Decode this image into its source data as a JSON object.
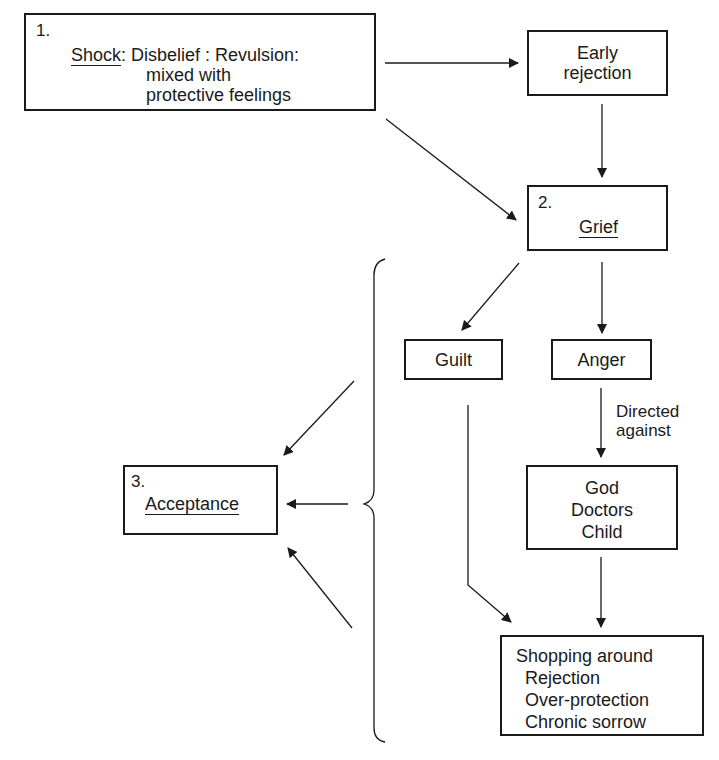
{
  "diagram": {
    "type": "flowchart",
    "nodes": {
      "shock": {
        "number": "1.",
        "title": "Shock",
        "line1_rest": ": Disbelief : Revulsion:",
        "line2": "mixed with",
        "line3": "protective feelings"
      },
      "early_rejection": {
        "line1": "Early",
        "line2": "rejection"
      },
      "grief": {
        "number": "2.",
        "title": "Grief"
      },
      "guilt": {
        "label": "Guilt"
      },
      "anger": {
        "label": "Anger"
      },
      "targets": {
        "line1": "God",
        "line2": "Doctors",
        "line3": "Child"
      },
      "outcomes": {
        "line1": "Shopping around",
        "line2": "Rejection",
        "line3": "Over-protection",
        "line4": "Chronic sorrow"
      },
      "acceptance": {
        "number": "3.",
        "title": "Acceptance"
      }
    },
    "edge_labels": {
      "directed_against": {
        "line1": "Directed",
        "line2": "against"
      }
    },
    "edges": [
      {
        "from": "shock",
        "to": "early_rejection"
      },
      {
        "from": "shock",
        "to": "grief"
      },
      {
        "from": "early_rejection",
        "to": "grief"
      },
      {
        "from": "grief",
        "to": "guilt"
      },
      {
        "from": "grief",
        "to": "anger"
      },
      {
        "from": "anger",
        "to": "targets",
        "label": "Directed against"
      },
      {
        "from": "guilt",
        "to": "outcomes"
      },
      {
        "from": "targets",
        "to": "outcomes"
      },
      {
        "from": "brace_group",
        "to": "acceptance",
        "count": 3
      }
    ],
    "colors": {
      "ink": "#1a1a1a",
      "background": "#ffffff"
    }
  }
}
